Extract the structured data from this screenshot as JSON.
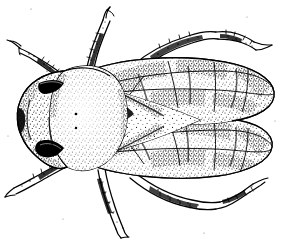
{
  "figure": {
    "view": "dorsal",
    "style": "stipple pen-and-ink scientific illustration",
    "background_color": "#ffffff",
    "ink_color": "#000000",
    "width": 283,
    "height": 242,
    "caption": "",
    "parts": [
      {
        "id": "head",
        "label": "head",
        "note": "rounded, bearing two dark eye patches"
      },
      {
        "id": "eye-upper",
        "label": "compound eye (upper)",
        "note": "solid black patch"
      },
      {
        "id": "eye-lower",
        "label": "compound eye (lower)",
        "note": "solid black patch"
      },
      {
        "id": "pronotum",
        "label": "pronotum",
        "note": "large stippled dome with two small punctures"
      },
      {
        "id": "scutellum",
        "label": "scutellum",
        "note": "triangular plate between wing bases"
      },
      {
        "id": "forewing-upper",
        "label": "forewing (left)",
        "note": "elongate, stippled, veined into cells"
      },
      {
        "id": "forewing-lower",
        "label": "forewing (right)",
        "note": "elongate, stippled, veined into cells"
      },
      {
        "id": "leg-front-left",
        "label": "front leg (left)",
        "note": "directed upper-left with hooked tarsus"
      },
      {
        "id": "leg-mid-left",
        "label": "middle leg (left)",
        "note": "directed upward"
      },
      {
        "id": "leg-hind-left",
        "label": "hind leg (left)",
        "note": "directed upper-right, spinose"
      },
      {
        "id": "leg-front-right",
        "label": "front leg (right)",
        "note": "directed lower-left"
      },
      {
        "id": "leg-mid-right",
        "label": "middle leg (right)",
        "note": "directed downward"
      },
      {
        "id": "leg-hind-right",
        "label": "hind leg (right)",
        "note": "directed lower-right, spinose"
      }
    ]
  }
}
